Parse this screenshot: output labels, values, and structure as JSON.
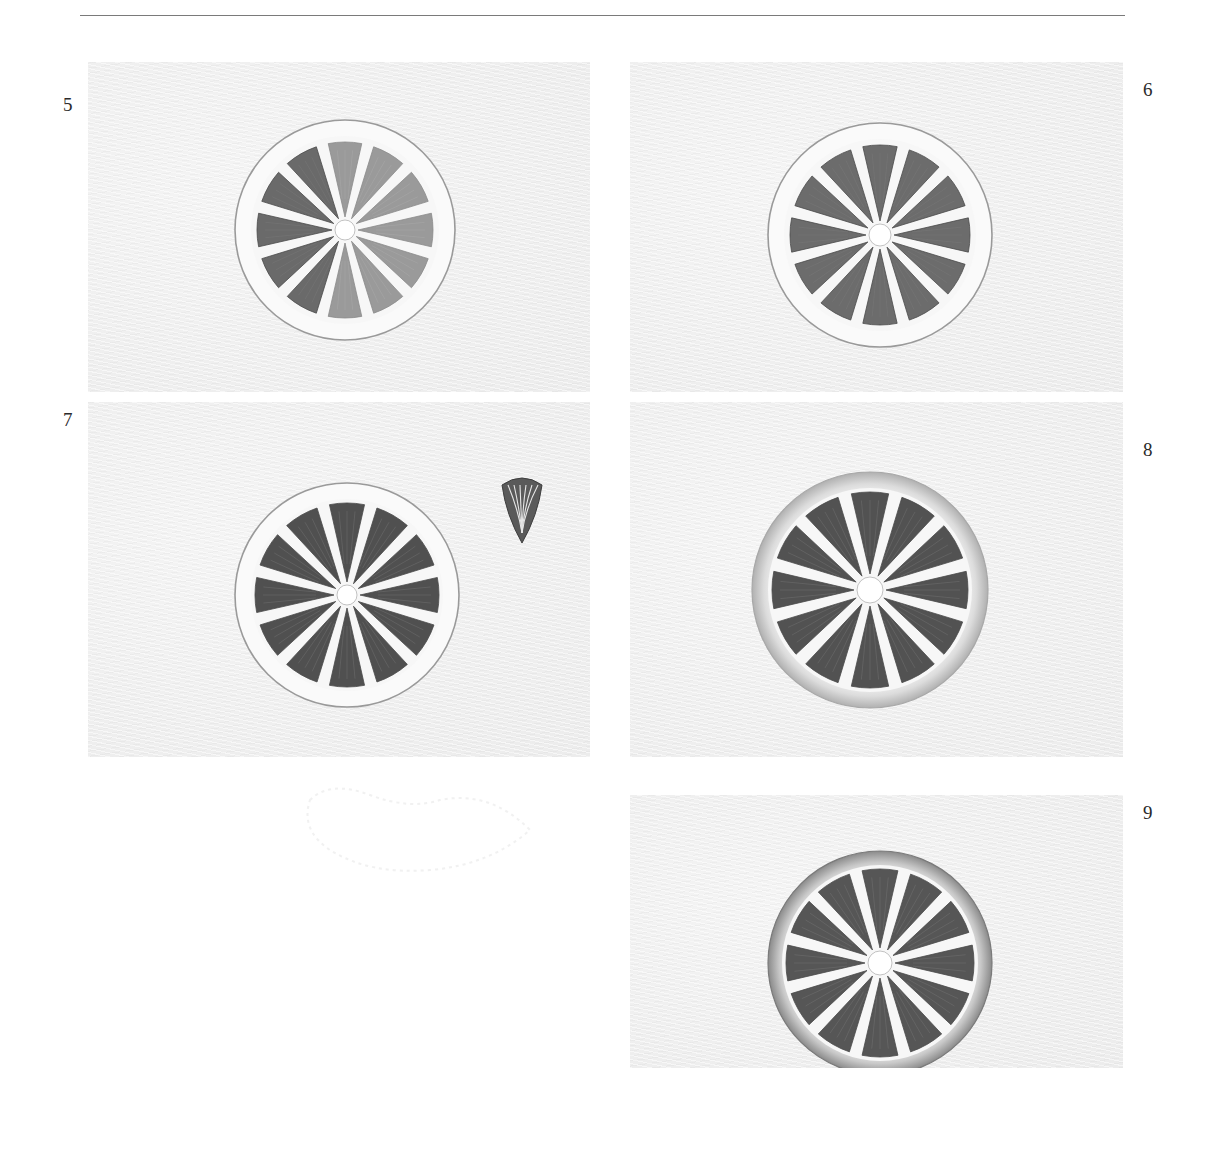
{
  "page": {
    "type": "drawing-tutorial-steps",
    "steps": [
      {
        "number": "5",
        "label_pos": {
          "x": 63,
          "y": 95
        },
        "panel": {
          "x": 88,
          "y": 62,
          "w": 502,
          "h": 330
        },
        "slice": {
          "cx": 345,
          "cy": 230,
          "r": 110,
          "pith_r": 94,
          "flesh_r": 88,
          "center_r": 10,
          "rind": "outline",
          "segments": 12,
          "lit_segments": [
            0,
            1,
            2,
            3,
            4,
            5,
            6
          ],
          "light_fill": "#9a9a9a",
          "dark_fill": "#6a6a6a"
        }
      },
      {
        "number": "6",
        "label_pos": {
          "x": 1143,
          "y": 80
        },
        "panel": {
          "x": 630,
          "y": 62,
          "w": 493,
          "h": 330
        },
        "slice": {
          "cx": 880,
          "cy": 235,
          "r": 112,
          "pith_r": 96,
          "flesh_r": 90,
          "center_r": 11,
          "rind": "outline",
          "segments": 12,
          "lit_segments": [],
          "light_fill": "#707070",
          "dark_fill": "#6c6c6c"
        }
      },
      {
        "number": "7",
        "label_pos": {
          "x": 63,
          "y": 410
        },
        "panel": {
          "x": 88,
          "y": 402,
          "w": 502,
          "h": 355
        },
        "slice": {
          "cx": 347,
          "cy": 595,
          "r": 112,
          "pith_r": 96,
          "flesh_r": 92,
          "center_r": 10,
          "rind": "outline",
          "segments": 12,
          "lit_segments": [],
          "light_fill": "#525252",
          "dark_fill": "#505050"
        },
        "detail": {
          "name": "single-segment-detail",
          "x": 498,
          "y": 475,
          "w": 48,
          "h": 70
        }
      },
      {
        "number": "8",
        "label_pos": {
          "x": 1143,
          "y": 440
        },
        "panel": {
          "x": 630,
          "y": 402,
          "w": 493,
          "h": 355
        },
        "slice": {
          "cx": 870,
          "cy": 590,
          "r": 118,
          "pith_r": 102,
          "flesh_r": 98,
          "center_r": 13,
          "rind": "shaded",
          "segments": 12,
          "lit_segments": [],
          "light_fill": "#545454",
          "dark_fill": "#525252"
        }
      },
      {
        "number": "9",
        "label_pos": {
          "x": 1143,
          "y": 803
        },
        "panel": {
          "x": 630,
          "y": 795,
          "w": 493,
          "h": 273
        },
        "slice": {
          "cx": 880,
          "cy": 963,
          "r": 112,
          "pith_r": 98,
          "flesh_r": 94,
          "center_r": 12,
          "rind": "shaded-dark",
          "segments": 12,
          "lit_segments": [],
          "light_fill": "#585858",
          "dark_fill": "#565656"
        }
      }
    ]
  }
}
